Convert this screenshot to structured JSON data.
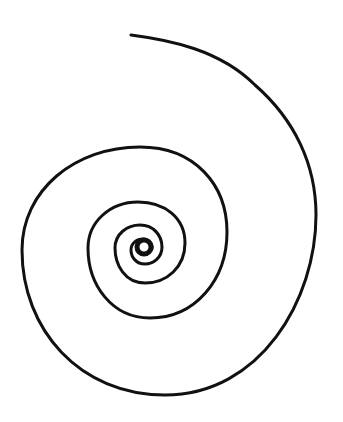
{
  "figure": {
    "type": "spiral-line-drawing",
    "stroke_color": "#111111",
    "background_color": "#ffffff",
    "stroke_width": 3,
    "center": [
      145,
      246
    ],
    "turns": 4
  }
}
